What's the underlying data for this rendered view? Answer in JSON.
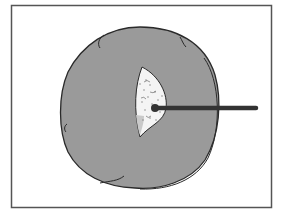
{
  "figure": {
    "kind": "illustration",
    "colors": {
      "background": "#ffffff",
      "frame": "#555555",
      "body_fill": "#9a9a9a",
      "outline": "#2a2a2a",
      "cavity_fill": "#f4f4f4",
      "rod": "#333333"
    }
  }
}
